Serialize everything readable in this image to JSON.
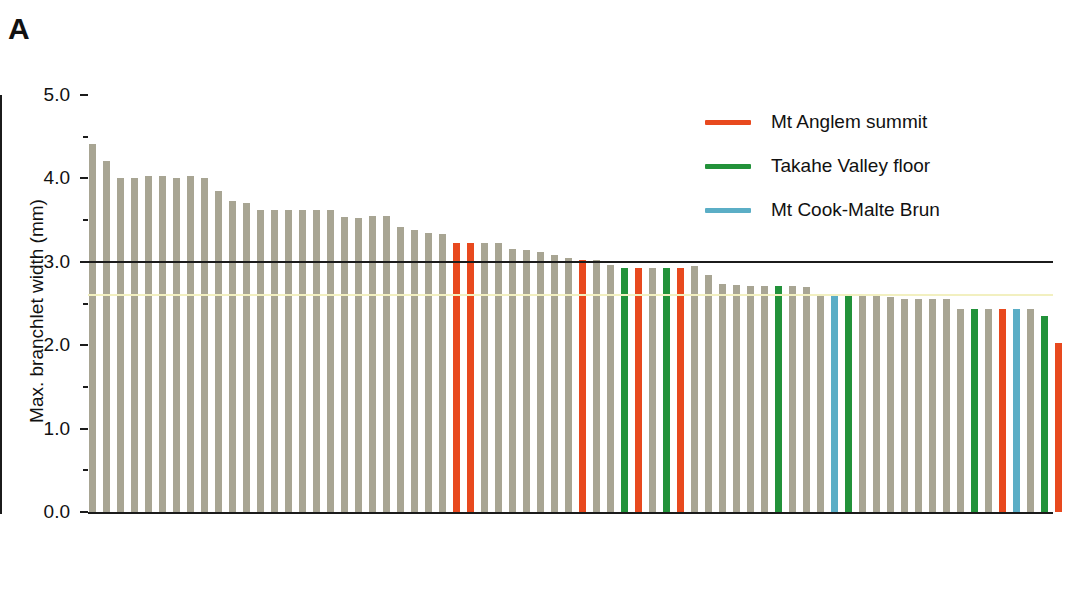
{
  "panel": {
    "label": "A"
  },
  "colors": {
    "grey": "#a8a593",
    "orange": "#e8491e",
    "green": "#22923a",
    "blue": "#5baec6",
    "threshold_line": "#1b1b1b",
    "mean_line": "#f2f0c0",
    "axis": "#1b1b1b"
  },
  "legend": {
    "position": "top-right",
    "items": [
      {
        "label": "Mt Anglem summit",
        "color": "#e8491e",
        "key": "orange"
      },
      {
        "label": "Takahe Valley floor",
        "color": "#22923a",
        "key": "green"
      },
      {
        "label": "Mt Cook-Malte Brun",
        "color": "#5baec6",
        "key": "blue"
      }
    ]
  },
  "chart_data": {
    "type": "bar",
    "title": "",
    "subtitle": "",
    "xlabel": "",
    "ylabel": "Max. branchlet width (mm)",
    "ylim": [
      0.0,
      5.0
    ],
    "ytick_labels": [
      "0.0",
      "1.0",
      "2.0",
      "3.0",
      "4.0",
      "5.0"
    ],
    "ytick_values": [
      0.0,
      1.0,
      2.0,
      3.0,
      4.0,
      5.0
    ],
    "yminor_ticks": [
      0.5,
      1.5,
      2.5,
      3.5,
      4.5
    ],
    "grid": false,
    "xtick_labels": [],
    "annotations": [
      {
        "name": "threshold-line",
        "type": "hline",
        "value": 3.0,
        "color": "#1b1b1b"
      },
      {
        "name": "mean-line",
        "type": "hline",
        "value": 2.6,
        "color": "#f2f0c0"
      }
    ],
    "series": [
      {
        "name": "Mt Anglem summit",
        "color": "#e8491e"
      },
      {
        "name": "Takahe Valley floor",
        "color": "#22923a"
      },
      {
        "name": "Mt Cook-Malte Brun",
        "color": "#5baec6"
      },
      {
        "name": "Other",
        "color": "#a8a593"
      }
    ],
    "values": [
      4.41,
      4.21,
      4.01,
      4.01,
      4.03,
      4.03,
      4.01,
      4.03,
      4.01,
      3.85,
      3.73,
      3.7,
      3.62,
      3.62,
      3.62,
      3.62,
      3.62,
      3.62,
      3.54,
      3.52,
      3.55,
      3.55,
      3.42,
      3.38,
      3.34,
      3.33,
      3.23,
      3.23,
      3.22,
      3.23,
      3.15,
      3.14,
      3.12,
      3.08,
      3.05,
      3.02,
      3.02,
      2.96,
      2.93,
      2.93,
      2.93,
      2.93,
      2.93,
      2.95,
      2.84,
      2.73,
      2.72,
      2.71,
      2.71,
      2.71,
      2.71,
      2.7,
      2.62,
      2.62,
      2.62,
      2.62,
      2.62,
      2.58,
      2.55,
      2.55,
      2.55,
      2.55,
      2.43,
      2.43,
      2.43,
      2.43,
      2.43,
      2.43,
      2.35,
      2.03
    ],
    "bar_colors": [
      "grey",
      "grey",
      "grey",
      "grey",
      "grey",
      "grey",
      "grey",
      "grey",
      "grey",
      "grey",
      "grey",
      "grey",
      "grey",
      "grey",
      "grey",
      "grey",
      "grey",
      "grey",
      "grey",
      "grey",
      "grey",
      "grey",
      "grey",
      "grey",
      "grey",
      "grey",
      "orange",
      "orange",
      "grey",
      "grey",
      "grey",
      "grey",
      "grey",
      "grey",
      "grey",
      "orange",
      "grey",
      "grey",
      "green",
      "orange",
      "grey",
      "green",
      "orange",
      "grey",
      "grey",
      "grey",
      "grey",
      "grey",
      "grey",
      "green",
      "grey",
      "grey",
      "grey",
      "blue",
      "green",
      "grey",
      "grey",
      "grey",
      "grey",
      "grey",
      "grey",
      "grey",
      "grey",
      "green",
      "grey",
      "orange",
      "blue",
      "grey",
      "green",
      "orange"
    ],
    "bar_x_centers": [
      92,
      106,
      120,
      134,
      148,
      162,
      176,
      190,
      204,
      218,
      232,
      246,
      260,
      274,
      288,
      302,
      316,
      330,
      344,
      358,
      372,
      386,
      400,
      414,
      428,
      442,
      456,
      470,
      484,
      498,
      512,
      526,
      540,
      554,
      568,
      582,
      596,
      610,
      624,
      638,
      652,
      666,
      680,
      694,
      708,
      722,
      736,
      750,
      764,
      778,
      792,
      806,
      820,
      834,
      848,
      862,
      876,
      890,
      904,
      918,
      932,
      946,
      960,
      974,
      988,
      1002,
      1016,
      1030,
      1044,
      1058
    ],
    "n_bars": 70,
    "sorted": "descending"
  }
}
